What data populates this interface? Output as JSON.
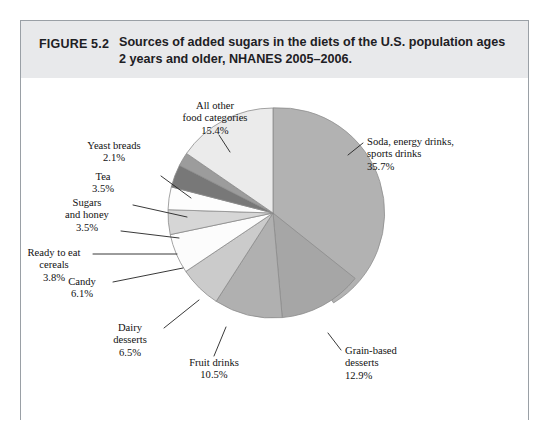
{
  "figure": {
    "number_label": "FIGURE 5.2",
    "title": "Sources of added sugars in the diets of the U.S. population ages 2 years and older, NHANES 2005–2006.",
    "title_line1": "Sources of added sugars in the diets of the U.S. population ages",
    "title_line2": "2 years and older, NHANES 2005–2006."
  },
  "colors": {
    "header_band": "#e8e9eb",
    "frame_border": "#9aa0a6",
    "page_background": "#ffffff",
    "text": "#111111",
    "slice_stroke": "#8c8c8c",
    "leader_line": "#222222"
  },
  "chart_data": {
    "type": "pie",
    "title": "Sources of added sugars in the diets of the U.S. population ages 2 years and older, NHANES 2005–2006.",
    "xlabel": "",
    "ylabel": "",
    "units": "percent",
    "start_angle_deg": 0,
    "direction": "clockwise",
    "legend": "none (direct labels with leader lines)",
    "grid": false,
    "categories": [
      "Soda, energy drinks, sports drinks",
      "Grain-based desserts",
      "Fruit drinks",
      "Dairy desserts",
      "Candy",
      "Ready to eat cereals",
      "Sugars and honey",
      "Tea",
      "Yeast breads",
      "All other food categories"
    ],
    "values": [
      35.7,
      12.9,
      10.5,
      6.5,
      6.1,
      3.8,
      3.5,
      3.5,
      2.1,
      15.4
    ],
    "value_labels": [
      "35.7%",
      "12.9%",
      "10.5%",
      "6.5%",
      "6.1%",
      "3.8%",
      "3.5%",
      "3.5%",
      "2.1%",
      "15.4%"
    ],
    "slice_colors": [
      "#b2b2b2",
      "#a6a6a6",
      "#b0b0b0",
      "#cbcbcb",
      "#fcfcfc",
      "#d6d6d6",
      "#fdfdfd",
      "#787878",
      "#9c9c9c",
      "#ebebeb"
    ],
    "slices": [
      {
        "name": "Soda, energy drinks, sports drinks",
        "value": 35.7,
        "label": "35.7%",
        "color": "#b2b2b2"
      },
      {
        "name": "Grain-based desserts",
        "value": 12.9,
        "label": "12.9%",
        "color": "#a6a6a6"
      },
      {
        "name": "Fruit drinks",
        "value": 10.5,
        "label": "10.5%",
        "color": "#b0b0b0"
      },
      {
        "name": "Dairy desserts",
        "value": 6.5,
        "label": "6.5%",
        "color": "#cbcbcb"
      },
      {
        "name": "Candy",
        "value": 6.1,
        "label": "6.1%",
        "color": "#fcfcfc"
      },
      {
        "name": "Ready to eat cereals",
        "value": 3.8,
        "label": "3.8%",
        "color": "#d6d6d6"
      },
      {
        "name": "Sugars and honey",
        "value": 3.5,
        "label": "3.5%",
        "color": "#fdfdfd"
      },
      {
        "name": "Tea",
        "value": 3.5,
        "label": "3.5%",
        "color": "#787878"
      },
      {
        "name": "Yeast breads",
        "value": 2.1,
        "label": "2.1%",
        "color": "#9c9c9c"
      },
      {
        "name": "All other food categories",
        "value": 15.4,
        "label": "15.4%",
        "color": "#ebebeb"
      }
    ]
  },
  "labels": {
    "all_other": {
      "line1": "All other",
      "line2": "food categories",
      "pct": "15.4%"
    },
    "yeast_breads": {
      "line1": "Yeast breads",
      "pct": "2.1%"
    },
    "tea": {
      "line1": "Tea",
      "pct": "3.5%"
    },
    "sugars_honey": {
      "line1": "Sugars",
      "line2": "and honey",
      "pct": "3.5%"
    },
    "cereals": {
      "line1": "Ready to eat",
      "line2": "cereals",
      "pct": "3.8%"
    },
    "candy": {
      "line1": "Candy",
      "pct": "6.1%"
    },
    "dairy": {
      "line1": "Dairy",
      "line2": "desserts",
      "pct": "6.5%"
    },
    "fruit_drinks": {
      "line1": "Fruit drinks",
      "pct": "10.5%"
    },
    "grain_desserts": {
      "line1": "Grain-based",
      "line2": "desserts",
      "pct": "12.9%"
    },
    "soda": {
      "line1": "Soda, energy drinks,",
      "line2": "sports drinks",
      "pct": "35.7%"
    }
  }
}
